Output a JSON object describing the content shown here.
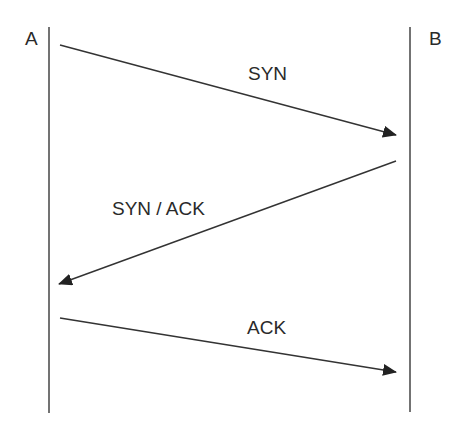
{
  "diagram": {
    "type": "sequence",
    "participants": [
      {
        "id": "A",
        "label": "A"
      },
      {
        "id": "B",
        "label": "B"
      }
    ],
    "messages": [
      {
        "from": "A",
        "to": "B",
        "label": "SYN"
      },
      {
        "from": "B",
        "to": "A",
        "label": "SYN / ACK"
      },
      {
        "from": "A",
        "to": "B",
        "label": "ACK"
      }
    ],
    "colors": {
      "line": "#333333",
      "text": "#2a2a2a",
      "background": "#ffffff"
    }
  }
}
